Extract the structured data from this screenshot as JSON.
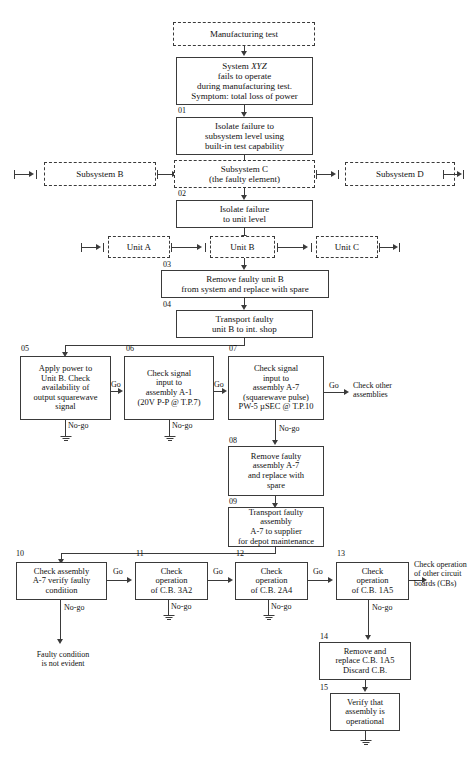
{
  "diagram": {
    "accent_color": "#3a3a3a",
    "background_color": "#ffffff"
  },
  "nodes": {
    "manufacturing_test": {
      "label": "Manufacturing test",
      "style": "dashed"
    },
    "system_xyz": {
      "label": "System XYZ\nfails to operate\nduring manufacturing test.\nSymptom: total loss of power",
      "style": "solid"
    },
    "step01": {
      "number": "01",
      "label": "Isolate failure to\nsubsystem level using\nbuilt-in test capability"
    },
    "subsystem_b": {
      "label": "Subsystem B",
      "style": "dashed"
    },
    "subsystem_c": {
      "label": "Subsystem C\n(the faulty element)",
      "style": "dashed"
    },
    "subsystem_d": {
      "label": "Subsystem D",
      "style": "dashed"
    },
    "step02": {
      "number": "02",
      "label": "Isolate failure\nto unit level"
    },
    "unit_a": {
      "label": "Unit A",
      "style": "dashed"
    },
    "unit_b": {
      "label": "Unit B",
      "style": "dashed"
    },
    "unit_c": {
      "label": "Unit C",
      "style": "dashed"
    },
    "step03": {
      "number": "03",
      "label": "Remove faulty unit B\nfrom system and replace with spare"
    },
    "step04": {
      "number": "04",
      "label": "Transport faulty\nunit B to int. shop"
    },
    "step05": {
      "number": "05",
      "label": "Apply power to\nUnit B. Check\navailability of\noutput squarewave\nsignal"
    },
    "step06": {
      "number": "06",
      "label": "Check signal\ninput to\nassembly A-1\n(20V P-P @ T.P.7)"
    },
    "step07": {
      "number": "07",
      "label": "Check signal\ninput to\nassembly A-7\n(squarewave pulse)\nPW-5 µSEC @ T.P.10"
    },
    "step08": {
      "number": "08",
      "label": "Remove faulty\nassembly A-7\nand replace with\nspare"
    },
    "step09": {
      "number": "09",
      "label": "Transport faulty assembly\nA-7 to supplier\nfor depot maintenance"
    },
    "step10": {
      "number": "10",
      "label": "Check assembly\nA-7 verify faulty\ncondition"
    },
    "step11": {
      "number": "11",
      "label": "Check\noperation\nof C.B. 3A2"
    },
    "step12": {
      "number": "12",
      "label": "Check\noperation\nof C.B. 2A4"
    },
    "step13": {
      "number": "13",
      "label": "Check\noperation\nof C.B. 1A5"
    },
    "step14": {
      "number": "14",
      "label": "Remove and\nreplace C.B. 1A5\nDiscard C.B."
    },
    "step15": {
      "number": "15",
      "label": "Verify that\nassembly is\noperational"
    }
  },
  "edge_labels": {
    "go_05_06": "Go",
    "go_06_07": "Go",
    "go_07_out": "Go",
    "go_10_11": "Go",
    "go_11_12": "Go",
    "go_12_13": "Go",
    "nogo_05": "No-go",
    "nogo_06": "No-go",
    "nogo_07": "No-go",
    "nogo_10": "No-go",
    "nogo_11": "No-go",
    "nogo_12": "No-go",
    "nogo_13": "No-go"
  },
  "terminal_text": {
    "check_other_assemblies": "Check other\nassemblies",
    "check_other_cbs": "Check operation\nof other circuit\nboards (CBs)",
    "faulty_not_evident": "Faulty condition\nis not evident"
  }
}
